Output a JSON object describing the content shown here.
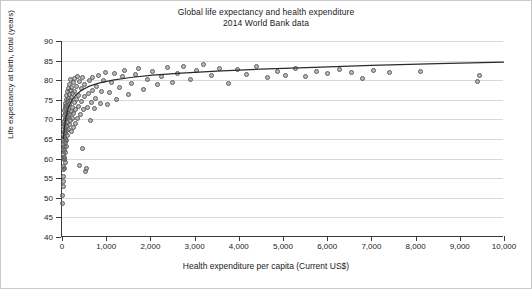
{
  "chart_data": {
    "type": "scatter",
    "title": "Global life expectancy and health expenditure",
    "subtitle": "2014 World Bank data",
    "xlabel": "Health expenditure per capita (Current US$)",
    "ylabel": "Life expectancy at birth, total (years)",
    "xlim": [
      0,
      10000
    ],
    "ylim": [
      40,
      90
    ],
    "xticks": [
      "0",
      "1,000",
      "2,000",
      "3,000",
      "4,000",
      "5,000",
      "6,000",
      "7,000",
      "8,000",
      "9,000",
      "10,000"
    ],
    "yticks": [
      "40",
      "45",
      "50",
      "55",
      "60",
      "65",
      "70",
      "75",
      "80",
      "85",
      "90"
    ],
    "grid": "horizontal",
    "legend": "none",
    "marker_color": "#767676",
    "line_color": "#2b2b2b",
    "series": [
      {
        "name": "Countries",
        "points": [
          [
            18,
            50.5
          ],
          [
            22,
            48.6
          ],
          [
            25,
            52.8
          ],
          [
            28,
            54.2
          ],
          [
            30,
            57.3
          ],
          [
            32,
            60.1
          ],
          [
            33,
            62.4
          ],
          [
            35,
            58.0
          ],
          [
            36,
            63.6
          ],
          [
            38,
            66.2
          ],
          [
            40,
            61.0
          ],
          [
            41,
            64.8
          ],
          [
            43,
            68.1
          ],
          [
            45,
            55.4
          ],
          [
            46,
            59.8
          ],
          [
            48,
            65.5
          ],
          [
            50,
            69.4
          ],
          [
            52,
            62.0
          ],
          [
            54,
            66.9
          ],
          [
            56,
            71.0
          ],
          [
            58,
            57.6
          ],
          [
            60,
            63.2
          ],
          [
            62,
            68.6
          ],
          [
            64,
            72.2
          ],
          [
            66,
            60.4
          ],
          [
            68,
            65.0
          ],
          [
            70,
            70.1
          ],
          [
            72,
            73.3
          ],
          [
            74,
            58.9
          ],
          [
            76,
            64.1
          ],
          [
            78,
            67.7
          ],
          [
            80,
            71.6
          ],
          [
            82,
            74.0
          ],
          [
            84,
            61.5
          ],
          [
            86,
            66.4
          ],
          [
            88,
            69.9
          ],
          [
            90,
            72.8
          ],
          [
            92,
            75.1
          ],
          [
            95,
            63.0
          ],
          [
            98,
            67.2
          ],
          [
            100,
            70.6
          ],
          [
            103,
            73.6
          ],
          [
            106,
            76.0
          ],
          [
            110,
            64.5
          ],
          [
            113,
            68.3
          ],
          [
            116,
            71.8
          ],
          [
            120,
            74.5
          ],
          [
            124,
            77.0
          ],
          [
            128,
            66.0
          ],
          [
            132,
            69.2
          ],
          [
            136,
            72.5
          ],
          [
            140,
            75.3
          ],
          [
            145,
            78.0
          ],
          [
            150,
            67.4
          ],
          [
            155,
            70.8
          ],
          [
            160,
            73.9
          ],
          [
            165,
            76.3
          ],
          [
            170,
            79.0
          ],
          [
            175,
            68.8
          ],
          [
            180,
            71.3
          ],
          [
            185,
            74.8
          ],
          [
            190,
            77.4
          ],
          [
            196,
            80.1
          ],
          [
            202,
            69.6
          ],
          [
            208,
            72.0
          ],
          [
            214,
            75.6
          ],
          [
            220,
            78.2
          ],
          [
            226,
            66.8
          ],
          [
            232,
            70.3
          ],
          [
            238,
            73.1
          ],
          [
            244,
            76.6
          ],
          [
            250,
            79.3
          ],
          [
            258,
            68.0
          ],
          [
            266,
            71.5
          ],
          [
            274,
            74.3
          ],
          [
            282,
            77.1
          ],
          [
            290,
            80.4
          ],
          [
            300,
            69.0
          ],
          [
            310,
            72.6
          ],
          [
            320,
            75.0
          ],
          [
            330,
            78.5
          ],
          [
            340,
            81.0
          ],
          [
            352,
            70.2
          ],
          [
            364,
            73.4
          ],
          [
            376,
            76.1
          ],
          [
            388,
            79.6
          ],
          [
            400,
            58.2
          ],
          [
            415,
            71.2
          ],
          [
            430,
            74.6
          ],
          [
            445,
            77.8
          ],
          [
            460,
            80.8
          ],
          [
            475,
            62.6
          ],
          [
            490,
            72.4
          ],
          [
            505,
            75.8
          ],
          [
            520,
            78.9
          ],
          [
            540,
            56.8
          ],
          [
            560,
            57.4
          ],
          [
            580,
            73.0
          ],
          [
            600,
            76.5
          ],
          [
            620,
            79.8
          ],
          [
            640,
            69.8
          ],
          [
            660,
            74.2
          ],
          [
            680,
            77.5
          ],
          [
            700,
            80.6
          ],
          [
            730,
            72.9
          ],
          [
            760,
            75.4
          ],
          [
            790,
            78.4
          ],
          [
            820,
            81.2
          ],
          [
            860,
            74.1
          ],
          [
            900,
            77.2
          ],
          [
            940,
            80.0
          ],
          [
            980,
            82.0
          ],
          [
            1030,
            73.7
          ],
          [
            1080,
            76.8
          ],
          [
            1130,
            79.4
          ],
          [
            1180,
            81.6
          ],
          [
            1240,
            75.2
          ],
          [
            1300,
            78.1
          ],
          [
            1360,
            80.9
          ],
          [
            1420,
            82.4
          ],
          [
            1500,
            76.4
          ],
          [
            1580,
            79.1
          ],
          [
            1660,
            81.4
          ],
          [
            1740,
            83.0
          ],
          [
            1840,
            77.6
          ],
          [
            1940,
            80.2
          ],
          [
            2040,
            82.2
          ],
          [
            2150,
            78.8
          ],
          [
            2260,
            81.0
          ],
          [
            2380,
            83.2
          ],
          [
            2500,
            79.5
          ],
          [
            2620,
            81.8
          ],
          [
            2760,
            83.6
          ],
          [
            2900,
            80.3
          ],
          [
            3050,
            82.6
          ],
          [
            3200,
            84.1
          ],
          [
            3380,
            81.1
          ],
          [
            3560,
            83.1
          ],
          [
            3760,
            79.2
          ],
          [
            3960,
            82.8
          ],
          [
            4180,
            81.5
          ],
          [
            4400,
            83.4
          ],
          [
            4640,
            80.7
          ],
          [
            4880,
            82.1
          ],
          [
            5060,
            81.3
          ],
          [
            5280,
            82.9
          ],
          [
            5500,
            80.9
          ],
          [
            5760,
            82.3
          ],
          [
            6000,
            81.7
          ],
          [
            6280,
            82.7
          ],
          [
            6560,
            81.9
          ],
          [
            6800,
            80.5
          ],
          [
            7040,
            82.5
          ],
          [
            7400,
            82.0
          ],
          [
            8100,
            82.2
          ],
          [
            9400,
            79.7
          ],
          [
            9450,
            81.2
          ]
        ]
      }
    ],
    "fit_curve": {
      "name": "Logarithmic fit",
      "points": [
        [
          30,
          65.0
        ],
        [
          60,
          68.6
        ],
        [
          100,
          71.1
        ],
        [
          150,
          73.1
        ],
        [
          220,
          74.8
        ],
        [
          320,
          76.3
        ],
        [
          450,
          77.5
        ],
        [
          620,
          78.5
        ],
        [
          850,
          79.3
        ],
        [
          1150,
          80.0
        ],
        [
          1550,
          80.7
        ],
        [
          2050,
          81.3
        ],
        [
          2700,
          81.8
        ],
        [
          3500,
          82.3
        ],
        [
          4500,
          82.8
        ],
        [
          5700,
          83.3
        ],
        [
          7000,
          83.8
        ],
        [
          8500,
          84.2
        ],
        [
          10000,
          84.6
        ]
      ]
    }
  }
}
